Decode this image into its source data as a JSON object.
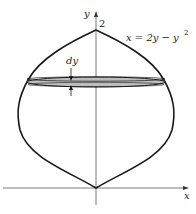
{
  "figure": {
    "y_axis_label": "y",
    "x_axis_label": "x",
    "y_tick_label": "2",
    "curve_equation": "x = 2y − y",
    "curve_equation_exponent": "2",
    "slice_label": "dy"
  },
  "colors": {
    "curve": "#1a1a1a",
    "axis": "#444444",
    "disk_fill": "#bdbdbd",
    "background": "#ffffff"
  }
}
